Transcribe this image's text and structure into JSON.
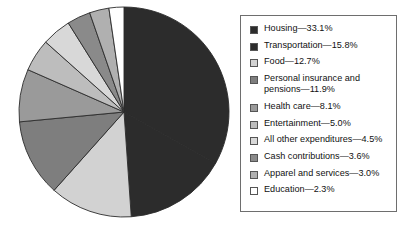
{
  "chart_data": {
    "type": "pie",
    "title": "",
    "unit": "percent",
    "start_angle_deg": 0,
    "direction": "clockwise",
    "categories": [
      "Housing",
      "Transportation",
      "Food",
      "Personal insurance and pensions",
      "Health care",
      "Entertainment",
      "All other expenditures",
      "Cash contributions",
      "Apparel and services",
      "Education"
    ],
    "values": [
      33.1,
      15.8,
      12.7,
      11.9,
      8.1,
      5.0,
      4.5,
      3.6,
      3.0,
      2.3
    ],
    "colors": [
      "#2c2c2c",
      "#2c2c2c",
      "#d2d2d2",
      "#7e7e7e",
      "#9a9a9a",
      "#bdbdbd",
      "#d8d8d8",
      "#8a8a8a",
      "#b0b0b0",
      "#ffffff"
    ],
    "slice_border_color": "#2b2b2b",
    "legend_position": "right",
    "grid": false
  },
  "legend": {
    "items": [
      {
        "label": "Housing—33.1%",
        "swatch": "#2c2c2c",
        "name": "legend-item-housing"
      },
      {
        "label": "Transportation—15.8%",
        "swatch": "#2c2c2c",
        "name": "legend-item-transportation"
      },
      {
        "label": "Food—12.7%",
        "swatch": "#d2d2d2",
        "name": "legend-item-food"
      },
      {
        "label": "Personal insurance and\npensions—11.9%",
        "swatch": "#7e7e7e",
        "name": "legend-item-personal-insurance-and-pensions"
      },
      {
        "label": "Health care—8.1%",
        "swatch": "#9a9a9a",
        "name": "legend-item-health-care"
      },
      {
        "label": "Entertainment—5.0%",
        "swatch": "#bdbdbd",
        "name": "legend-item-entertainment"
      },
      {
        "label": "All other expenditures—4.5%",
        "swatch": "#d8d8d8",
        "name": "legend-item-all-other-expenditures"
      },
      {
        "label": "Cash contributions—3.6%",
        "swatch": "#8a8a8a",
        "name": "legend-item-cash-contributions"
      },
      {
        "label": "Apparel and services—3.0%",
        "swatch": "#b0b0b0",
        "name": "legend-item-apparel-and-services"
      },
      {
        "label": "Education—2.3%",
        "swatch": "#ffffff",
        "name": "legend-item-education"
      }
    ]
  }
}
